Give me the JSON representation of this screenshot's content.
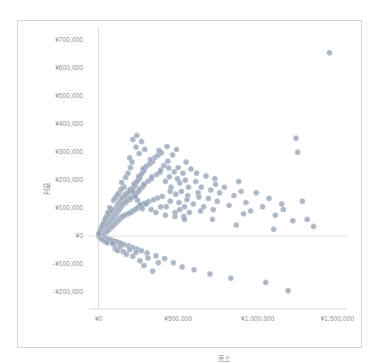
{
  "chart_data": {
    "type": "scatter",
    "title": "",
    "subtitle": "",
    "xlabel": "売上",
    "ylabel": "利益",
    "xlim": [
      -60000,
      1560000
    ],
    "ylim": [
      -260000,
      740000
    ],
    "grid": true,
    "grid_lines": "horizontal-zero-only",
    "legend": null,
    "legend_position": "none",
    "marker": {
      "shape": "circle",
      "fill_color": "#8c9bb0",
      "edge_color": "#b9c3d0",
      "size_px": 5,
      "opacity": 0.72
    },
    "axis_color": "#d8d8d8",
    "tick_label_color": "#8c8c8c",
    "xticks": [
      0,
      500000,
      1000000,
      1500000
    ],
    "xtick_labels": [
      "¥0",
      "¥500,000",
      "¥1,000,000",
      "¥1,500,000"
    ],
    "yticks": [
      700000,
      600000,
      500000,
      400000,
      300000,
      200000,
      100000,
      0,
      -100000,
      -200000
    ],
    "ytick_labels": [
      "¥700,000",
      "¥600,000",
      "¥500,000",
      "¥400,000",
      "¥300,000",
      "¥200,000",
      "¥100,000",
      "¥0",
      "-¥100,000",
      "-¥200,000"
    ],
    "points": [
      [
        3000,
        1000
      ],
      [
        5000,
        2000
      ],
      [
        7000,
        -1000
      ],
      [
        9000,
        3000
      ],
      [
        11000,
        5000
      ],
      [
        4000,
        6000
      ],
      [
        6000,
        -3000
      ],
      [
        8000,
        8000
      ],
      [
        10000,
        1500
      ],
      [
        12000,
        4000
      ],
      [
        14000,
        9000
      ],
      [
        16000,
        2500
      ],
      [
        18000,
        11000
      ],
      [
        20000,
        6500
      ],
      [
        22000,
        14000
      ],
      [
        13000,
        -4000
      ],
      [
        15000,
        12000
      ],
      [
        17000,
        3000
      ],
      [
        19000,
        16000
      ],
      [
        21000,
        8000
      ],
      [
        23000,
        18000
      ],
      [
        25000,
        10000
      ],
      [
        27000,
        21000
      ],
      [
        29000,
        13000
      ],
      [
        31000,
        24000
      ],
      [
        24000,
        -2000
      ],
      [
        26000,
        5000
      ],
      [
        28000,
        26000
      ],
      [
        30000,
        17000
      ],
      [
        32000,
        7000
      ],
      [
        34000,
        28000
      ],
      [
        36000,
        19000
      ],
      [
        38000,
        31000
      ],
      [
        40000,
        22000
      ],
      [
        42000,
        34000
      ],
      [
        33000,
        -6000
      ],
      [
        35000,
        9000
      ],
      [
        37000,
        36000
      ],
      [
        39000,
        24000
      ],
      [
        41000,
        12000
      ],
      [
        43000,
        38000
      ],
      [
        45000,
        27000
      ],
      [
        47000,
        41000
      ],
      [
        49000,
        30000
      ],
      [
        51000,
        44000
      ],
      [
        44000,
        -8000
      ],
      [
        46000,
        14000
      ],
      [
        48000,
        46000
      ],
      [
        50000,
        33000
      ],
      [
        52000,
        17000
      ],
      [
        54000,
        48000
      ],
      [
        56000,
        36000
      ],
      [
        58000,
        51000
      ],
      [
        60000,
        39000
      ],
      [
        62000,
        54000
      ],
      [
        55000,
        -10000
      ],
      [
        57000,
        20000
      ],
      [
        59000,
        56000
      ],
      [
        61000,
        42000
      ],
      [
        63000,
        23000
      ],
      [
        65000,
        58000
      ],
      [
        67000,
        45000
      ],
      [
        69000,
        61000
      ],
      [
        71000,
        48000
      ],
      [
        73000,
        64000
      ],
      [
        66000,
        -12000
      ],
      [
        68000,
        26000
      ],
      [
        70000,
        66000
      ],
      [
        72000,
        51000
      ],
      [
        74000,
        29000
      ],
      [
        76000,
        68000
      ],
      [
        78000,
        54000
      ],
      [
        80000,
        71000
      ],
      [
        82000,
        57000
      ],
      [
        84000,
        74000
      ],
      [
        77000,
        -14000
      ],
      [
        79000,
        32000
      ],
      [
        81000,
        76000
      ],
      [
        83000,
        60000
      ],
      [
        85000,
        35000
      ],
      [
        87000,
        78000
      ],
      [
        89000,
        63000
      ],
      [
        91000,
        81000
      ],
      [
        93000,
        66000
      ],
      [
        95000,
        84000
      ],
      [
        88000,
        -16000
      ],
      [
        90000,
        38000
      ],
      [
        92000,
        86000
      ],
      [
        94000,
        69000
      ],
      [
        96000,
        41000
      ],
      [
        98000,
        88000
      ],
      [
        100000,
        72000
      ],
      [
        102000,
        91000
      ],
      [
        104000,
        75000
      ],
      [
        106000,
        94000
      ],
      [
        99000,
        -18000
      ],
      [
        101000,
        44000
      ],
      [
        103000,
        96000
      ],
      [
        105000,
        78000
      ],
      [
        107000,
        47000
      ],
      [
        109000,
        98000
      ],
      [
        111000,
        81000
      ],
      [
        113000,
        101000
      ],
      [
        115000,
        84000
      ],
      [
        117000,
        104000
      ],
      [
        110000,
        -20000
      ],
      [
        112000,
        50000
      ],
      [
        114000,
        106000
      ],
      [
        116000,
        87000
      ],
      [
        118000,
        53000
      ],
      [
        120000,
        108000
      ],
      [
        122000,
        90000
      ],
      [
        124000,
        111000
      ],
      [
        126000,
        93000
      ],
      [
        128000,
        114000
      ],
      [
        121000,
        -22000
      ],
      [
        123000,
        56000
      ],
      [
        125000,
        116000
      ],
      [
        127000,
        96000
      ],
      [
        129000,
        59000
      ],
      [
        131000,
        118000
      ],
      [
        133000,
        99000
      ],
      [
        135000,
        121000
      ],
      [
        137000,
        102000
      ],
      [
        139000,
        124000
      ],
      [
        132000,
        -24000
      ],
      [
        134000,
        62000
      ],
      [
        136000,
        126000
      ],
      [
        138000,
        105000
      ],
      [
        140000,
        65000
      ],
      [
        142000,
        128000
      ],
      [
        144000,
        108000
      ],
      [
        146000,
        131000
      ],
      [
        148000,
        111000
      ],
      [
        150000,
        134000
      ],
      [
        143000,
        -26000
      ],
      [
        145000,
        68000
      ],
      [
        147000,
        136000
      ],
      [
        149000,
        114000
      ],
      [
        151000,
        71000
      ],
      [
        155000,
        139000
      ],
      [
        160000,
        117000
      ],
      [
        165000,
        142000
      ],
      [
        170000,
        120000
      ],
      [
        175000,
        146000
      ],
      [
        158000,
        -30000
      ],
      [
        163000,
        74000
      ],
      [
        168000,
        150000
      ],
      [
        173000,
        124000
      ],
      [
        178000,
        78000
      ],
      [
        183000,
        154000
      ],
      [
        188000,
        128000
      ],
      [
        193000,
        158000
      ],
      [
        198000,
        132000
      ],
      [
        203000,
        162000
      ],
      [
        186000,
        -34000
      ],
      [
        191000,
        82000
      ],
      [
        196000,
        166000
      ],
      [
        201000,
        136000
      ],
      [
        206000,
        86000
      ],
      [
        211000,
        170000
      ],
      [
        216000,
        140000
      ],
      [
        221000,
        176000
      ],
      [
        226000,
        145000
      ],
      [
        231000,
        182000
      ],
      [
        214000,
        -40000
      ],
      [
        219000,
        92000
      ],
      [
        224000,
        188000
      ],
      [
        229000,
        150000
      ],
      [
        234000,
        96000
      ],
      [
        239000,
        194000
      ],
      [
        244000,
        156000
      ],
      [
        249000,
        200000
      ],
      [
        254000,
        162000
      ],
      [
        259000,
        208000
      ],
      [
        242000,
        -46000
      ],
      [
        247000,
        102000
      ],
      [
        252000,
        214000
      ],
      [
        257000,
        168000
      ],
      [
        262000,
        108000
      ],
      [
        267000,
        220000
      ],
      [
        272000,
        174000
      ],
      [
        277000,
        228000
      ],
      [
        282000,
        180000
      ],
      [
        287000,
        236000
      ],
      [
        270000,
        -52000
      ],
      [
        275000,
        114000
      ],
      [
        280000,
        242000
      ],
      [
        285000,
        186000
      ],
      [
        290000,
        118000
      ],
      [
        300000,
        250000
      ],
      [
        310000,
        196000
      ],
      [
        320000,
        258000
      ],
      [
        330000,
        204000
      ],
      [
        340000,
        266000
      ],
      [
        305000,
        -60000
      ],
      [
        315000,
        124000
      ],
      [
        325000,
        274000
      ],
      [
        335000,
        212000
      ],
      [
        345000,
        130000
      ],
      [
        355000,
        282000
      ],
      [
        365000,
        220000
      ],
      [
        375000,
        290000
      ],
      [
        385000,
        228000
      ],
      [
        395000,
        298000
      ],
      [
        360000,
        -70000
      ],
      [
        370000,
        136000
      ],
      [
        380000,
        306000
      ],
      [
        390000,
        236000
      ],
      [
        400000,
        142000
      ],
      [
        410000,
        252000
      ],
      [
        420000,
        196000
      ],
      [
        430000,
        320000
      ],
      [
        440000,
        244000
      ],
      [
        450000,
        160000
      ],
      [
        415000,
        -80000
      ],
      [
        425000,
        105000
      ],
      [
        435000,
        268000
      ],
      [
        445000,
        212000
      ],
      [
        455000,
        175000
      ],
      [
        465000,
        290000
      ],
      [
        475000,
        230000
      ],
      [
        485000,
        150000
      ],
      [
        495000,
        205000
      ],
      [
        505000,
        120000
      ],
      [
        470000,
        -95000
      ],
      [
        480000,
        85000
      ],
      [
        490000,
        310000
      ],
      [
        500000,
        245000
      ],
      [
        510000,
        190000
      ],
      [
        520000,
        160000
      ],
      [
        530000,
        225000
      ],
      [
        540000,
        105000
      ],
      [
        550000,
        265000
      ],
      [
        560000,
        145000
      ],
      [
        525000,
        -110000
      ],
      [
        535000,
        70000
      ],
      [
        545000,
        200000
      ],
      [
        555000,
        130000
      ],
      [
        565000,
        175000
      ],
      [
        580000,
        240000
      ],
      [
        595000,
        115000
      ],
      [
        610000,
        195000
      ],
      [
        625000,
        155000
      ],
      [
        640000,
        90000
      ],
      [
        600000,
        -120000
      ],
      [
        615000,
        225000
      ],
      [
        630000,
        140000
      ],
      [
        645000,
        175000
      ],
      [
        660000,
        105000
      ],
      [
        675000,
        215000
      ],
      [
        690000,
        135000
      ],
      [
        705000,
        165000
      ],
      [
        720000,
        95000
      ],
      [
        735000,
        185000
      ],
      [
        700000,
        -135000
      ],
      [
        715000,
        60000
      ],
      [
        730000,
        205000
      ],
      [
        745000,
        125000
      ],
      [
        760000,
        155000
      ],
      [
        790000,
        175000
      ],
      [
        820000,
        110000
      ],
      [
        850000,
        145000
      ],
      [
        880000,
        195000
      ],
      [
        910000,
        80000
      ],
      [
        830000,
        -150000
      ],
      [
        865000,
        40000
      ],
      [
        895000,
        160000
      ],
      [
        925000,
        120000
      ],
      [
        955000,
        90000
      ],
      [
        990000,
        155000
      ],
      [
        1030000,
        105000
      ],
      [
        1070000,
        135000
      ],
      [
        1110000,
        75000
      ],
      [
        1150000,
        115000
      ],
      [
        1050000,
        -165000
      ],
      [
        1100000,
        25000
      ],
      [
        1160000,
        95000
      ],
      [
        1220000,
        55000
      ],
      [
        1280000,
        125000
      ],
      [
        1190000,
        -195000
      ],
      [
        1250000,
        300000
      ],
      [
        1310000,
        60000
      ],
      [
        1350000,
        35000
      ],
      [
        1240000,
        350000
      ],
      [
        160000,
        175000
      ],
      [
        145000,
        192000
      ],
      [
        170000,
        210000
      ],
      [
        185000,
        225000
      ],
      [
        200000,
        245000
      ],
      [
        215000,
        160000
      ],
      [
        230000,
        142000
      ],
      [
        245000,
        128000
      ],
      [
        260000,
        112000
      ],
      [
        275000,
        98000
      ],
      [
        155000,
        -55000
      ],
      [
        175000,
        -65000
      ],
      [
        195000,
        -48000
      ],
      [
        215000,
        -72000
      ],
      [
        235000,
        -58000
      ],
      [
        260000,
        -88000
      ],
      [
        285000,
        -105000
      ],
      [
        310000,
        -78000
      ],
      [
        340000,
        -125000
      ],
      [
        375000,
        -95000
      ],
      [
        195000,
        280000
      ],
      [
        210000,
        265000
      ],
      [
        235000,
        318000
      ],
      [
        255000,
        295000
      ],
      [
        270000,
        338000
      ],
      [
        290000,
        310000
      ],
      [
        215000,
        345000
      ],
      [
        240000,
        360000
      ],
      [
        1450000,
        655000
      ],
      [
        105000,
        -45000
      ],
      [
        120000,
        -52000
      ],
      [
        135000,
        -38000
      ],
      [
        95000,
        -30000
      ],
      [
        88000,
        -25000
      ],
      [
        82000,
        95000
      ],
      [
        76000,
        88000
      ],
      [
        70000,
        102000
      ],
      [
        64000,
        78000
      ],
      [
        58000,
        85000
      ],
      [
        52000,
        72000
      ],
      [
        46000,
        65000
      ],
      [
        40000,
        58000
      ],
      [
        34000,
        48000
      ],
      [
        28000,
        42000
      ],
      [
        22000,
        35000
      ],
      [
        16000,
        28000
      ],
      [
        10000,
        20000
      ],
      [
        6000,
        14000
      ],
      [
        2000,
        8000
      ],
      [
        15000,
        -8000
      ],
      [
        25000,
        -12000
      ],
      [
        35000,
        -16000
      ],
      [
        45000,
        -20000
      ],
      [
        55000,
        -24000
      ],
      [
        300000,
        115000
      ],
      [
        330000,
        95000
      ],
      [
        360000,
        85000
      ],
      [
        390000,
        105000
      ],
      [
        420000,
        75000
      ],
      [
        450000,
        125000
      ],
      [
        480000,
        70000
      ],
      [
        510000,
        95000
      ],
      [
        540000,
        60000
      ],
      [
        570000,
        85000
      ],
      [
        130000,
        155000
      ],
      [
        142000,
        168000
      ],
      [
        118000,
        148000
      ],
      [
        106000,
        138000
      ],
      [
        94000,
        128000
      ]
    ]
  }
}
